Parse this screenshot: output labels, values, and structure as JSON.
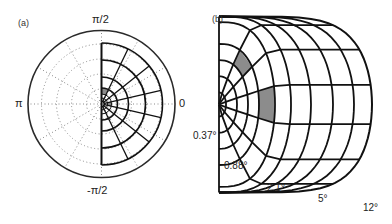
{
  "panels": {
    "a": {
      "label": "(a)",
      "angle_labels": {
        "top": "π/2",
        "left": "π",
        "right": "0",
        "bottom": "-π/2"
      },
      "center": [
        101.5,
        104
      ],
      "outer_radius": 73.5,
      "grid_rings": [
        3,
        6,
        10,
        16,
        27,
        44,
        61
      ],
      "dotted_rings": [
        15,
        30,
        45,
        60
      ],
      "sectors": 7,
      "shaded_cells": [
        {
          "ring": 3,
          "sector": 6
        },
        {
          "ring": 2,
          "sector": 3
        }
      ]
    },
    "b": {
      "label": "(b)",
      "eccentricity_labels": [
        "0.37°",
        "0.88°",
        "2.1°",
        "5°",
        "12°"
      ],
      "apex": [
        219,
        104.5
      ],
      "ring_x": [
        226,
        237,
        248,
        259,
        275,
        291,
        311,
        333,
        354,
        372
      ],
      "sectors": 7,
      "shaded_cells": [
        {
          "ring": 2,
          "sector": 5
        },
        {
          "ring": 3,
          "sector": 3
        }
      ]
    }
  },
  "colors": {
    "line": "#111111",
    "dotted": "#8a8a8a",
    "shade": "#8c8c8c",
    "outer": "#2a2a2a"
  }
}
